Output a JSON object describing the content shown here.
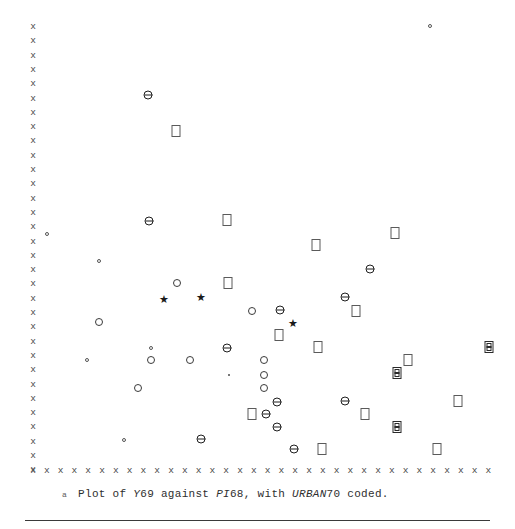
{
  "figure": {
    "caption_marker": "a",
    "caption_segments": [
      {
        "text": "Plot of ",
        "style": "normal"
      },
      {
        "text": "Y",
        "style": "italic"
      },
      {
        "text": "69 against ",
        "style": "normal"
      },
      {
        "text": "PI",
        "style": "italic"
      },
      {
        "text": "68, with ",
        "style": "normal"
      },
      {
        "text": "URBAN",
        "style": "italic"
      },
      {
        "text": "70 coded.",
        "style": "normal"
      }
    ],
    "caption_plain": "Plot of Y69 against PI68, with URBAN70 coded.",
    "axis_tick_glyph": "x",
    "colors": {
      "ink": "#1a1a1a",
      "axis": "#4a4a4a",
      "rule": "#3a3a3a",
      "background": "#ffffff"
    }
  },
  "chart_data": {
    "type": "scatter",
    "title": "Plot of Y69 against PI68, with URBAN70 coded.",
    "xlabel": "PI68",
    "ylabel": "Y69",
    "legend_note": "URBAN70 coded by plotting symbol",
    "grid": false,
    "legend": "none",
    "axis_style": "ascii-x-glyph-ticks",
    "xlim": [
      0,
      515
    ],
    "ylim": [
      0,
      529
    ],
    "y_axis_ticks": 32,
    "x_axis_ticks": 34,
    "symbols": [
      {
        "key": "dot",
        "name": "small-open-circle",
        "count": 6
      },
      {
        "key": "point",
        "name": "tiny-filled-point",
        "count": 1
      },
      {
        "key": "circle",
        "name": "open-circle",
        "count": 9
      },
      {
        "key": "barcircle",
        "name": "circle-with-bar",
        "count": 16
      },
      {
        "key": "square",
        "name": "open-square",
        "count": 17
      },
      {
        "key": "boxed",
        "name": "boxed-square",
        "count": 4
      },
      {
        "key": "star",
        "name": "star",
        "count": 3
      }
    ],
    "points": [
      {
        "x": 430,
        "y": 26,
        "symbol": "dot"
      },
      {
        "x": 148,
        "y": 95,
        "symbol": "barcircle"
      },
      {
        "x": 176,
        "y": 131,
        "symbol": "square"
      },
      {
        "x": 149,
        "y": 221,
        "symbol": "barcircle"
      },
      {
        "x": 227,
        "y": 220,
        "symbol": "square"
      },
      {
        "x": 47,
        "y": 234,
        "symbol": "dot"
      },
      {
        "x": 395,
        "y": 233,
        "symbol": "square"
      },
      {
        "x": 316,
        "y": 245,
        "symbol": "square"
      },
      {
        "x": 99,
        "y": 261,
        "symbol": "dot"
      },
      {
        "x": 370,
        "y": 269,
        "symbol": "barcircle"
      },
      {
        "x": 177,
        "y": 283,
        "symbol": "circle"
      },
      {
        "x": 228,
        "y": 283,
        "symbol": "square"
      },
      {
        "x": 163,
        "y": 299,
        "symbol": "star"
      },
      {
        "x": 200,
        "y": 297,
        "symbol": "star"
      },
      {
        "x": 345,
        "y": 297,
        "symbol": "barcircle"
      },
      {
        "x": 252,
        "y": 311,
        "symbol": "circle"
      },
      {
        "x": 280,
        "y": 310,
        "symbol": "barcircle"
      },
      {
        "x": 356,
        "y": 311,
        "symbol": "square"
      },
      {
        "x": 99,
        "y": 322,
        "symbol": "circle"
      },
      {
        "x": 292,
        "y": 323,
        "symbol": "star"
      },
      {
        "x": 279,
        "y": 335,
        "symbol": "square"
      },
      {
        "x": 151,
        "y": 348,
        "symbol": "dot"
      },
      {
        "x": 227,
        "y": 348,
        "symbol": "barcircle"
      },
      {
        "x": 318,
        "y": 347,
        "symbol": "square"
      },
      {
        "x": 489,
        "y": 347,
        "symbol": "boxed"
      },
      {
        "x": 87,
        "y": 360,
        "symbol": "dot"
      },
      {
        "x": 151,
        "y": 360,
        "symbol": "circle"
      },
      {
        "x": 190,
        "y": 360,
        "symbol": "circle"
      },
      {
        "x": 264,
        "y": 360,
        "symbol": "circle"
      },
      {
        "x": 408,
        "y": 360,
        "symbol": "square"
      },
      {
        "x": 229,
        "y": 375,
        "symbol": "point"
      },
      {
        "x": 264,
        "y": 375,
        "symbol": "circle"
      },
      {
        "x": 397,
        "y": 373,
        "symbol": "boxed"
      },
      {
        "x": 138,
        "y": 388,
        "symbol": "circle"
      },
      {
        "x": 264,
        "y": 388,
        "symbol": "circle"
      },
      {
        "x": 277,
        "y": 402,
        "symbol": "barcircle"
      },
      {
        "x": 345,
        "y": 401,
        "symbol": "barcircle"
      },
      {
        "x": 458,
        "y": 401,
        "symbol": "square"
      },
      {
        "x": 252,
        "y": 414,
        "symbol": "square"
      },
      {
        "x": 266,
        "y": 414,
        "symbol": "barcircle"
      },
      {
        "x": 365,
        "y": 414,
        "symbol": "square"
      },
      {
        "x": 277,
        "y": 427,
        "symbol": "barcircle"
      },
      {
        "x": 397,
        "y": 427,
        "symbol": "boxed"
      },
      {
        "x": 124,
        "y": 440,
        "symbol": "dot"
      },
      {
        "x": 201,
        "y": 439,
        "symbol": "barcircle"
      },
      {
        "x": 294,
        "y": 449,
        "symbol": "barcircle"
      },
      {
        "x": 322,
        "y": 449,
        "symbol": "square"
      },
      {
        "x": 437,
        "y": 449,
        "symbol": "square"
      }
    ],
    "y_axis": {
      "x": 33,
      "top": 22,
      "bottom": 466,
      "step": 14.3
    },
    "x_axis": {
      "y": 466,
      "left": 33,
      "right": 489,
      "step": 13.8
    }
  }
}
